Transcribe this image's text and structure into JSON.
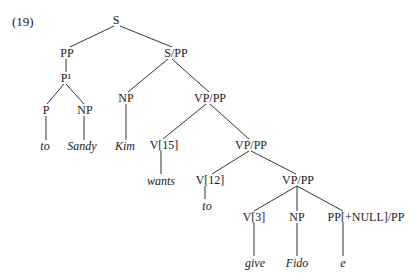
{
  "example_number": "(19)",
  "nodes": {
    "s": "S",
    "pp": "PP",
    "s_pp": "S/PP",
    "p_bar": "P¹",
    "p": "P",
    "np_sandy": "NP",
    "np_kim": "NP",
    "vp_pp_1": "VP/PP",
    "v15": "V[15]",
    "vp_pp_2": "VP/PP",
    "v12": "V[12]",
    "vp_pp_3": "VP/PP",
    "v3": "V[3]",
    "np_fido": "NP",
    "pp_null": "PP[+NULL]/PP"
  },
  "leaves": {
    "to_1": "to",
    "sandy": "Sandy",
    "kim": "Kim",
    "wants": "wants",
    "to_2": "to",
    "give": "give",
    "fido": "Fido",
    "e": "e"
  }
}
